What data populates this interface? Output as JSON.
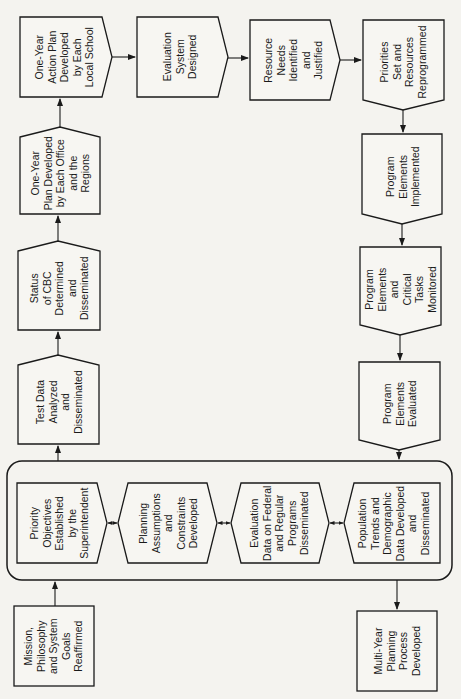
{
  "diagram": {
    "type": "flowchart",
    "orientation": "rotated-90-ccw",
    "nodes": {
      "mission": "Mission,\nPhilosophy\nand System\nGoals\nReaffirmed",
      "priority_objectives": "Priority\nObjectives\nEstablished\nby the\nSuperintendent",
      "planning_assumptions": "Planning\nAssumptions\nand\nConstraints\nDeveloped",
      "evaluation_data": "Evaluation\nData on Federal\nand Regular\nPrograms\nDisseminated",
      "population_trends": "Population\nTrends and\nDemographic\nData Developed\nand\nDisseminated",
      "multi_year": "Multi-Year\nPlanning\nProcess\nDeveloped",
      "test_data": "Test Data\nAnalyzed\nand\nDisseminated",
      "status_cbc": "Status\nof CBC\nDetermined\nand\nDisseminated",
      "one_year_plan": "One-Year\nPlan Developed\nby Each Office\nand the\nRegions",
      "one_year_action": "One-Year\nAction Plan\nDeveloped\nby Each\nLocal School",
      "evaluation_system": "Evaluation\nSystem\nDesigned",
      "resource_needs": "Resource\nNeeds\nIdentified\nand\nJustified",
      "priorities_set": "Priorities\nSet and\nResources\nReprogrammed",
      "program_implemented": "Program\nElements\nImplemented",
      "program_monitored": "Program\nElements\nand\nCritical\nTasks\nMonitored",
      "program_evaluated": "Program\nElements\nEvaluated"
    },
    "edges": [
      [
        "mission",
        "group"
      ],
      [
        "group",
        "multi_year"
      ],
      [
        "group",
        "test_data"
      ],
      [
        "test_data",
        "status_cbc"
      ],
      [
        "status_cbc",
        "one_year_plan"
      ],
      [
        "one_year_plan",
        "one_year_action"
      ],
      [
        "one_year_action",
        "evaluation_system"
      ],
      [
        "evaluation_system",
        "resource_needs"
      ],
      [
        "resource_needs",
        "priorities_set"
      ],
      [
        "priorities_set",
        "program_implemented"
      ],
      [
        "program_implemented",
        "program_monitored"
      ],
      [
        "program_monitored",
        "program_evaluated"
      ],
      [
        "program_evaluated",
        "group"
      ]
    ]
  }
}
